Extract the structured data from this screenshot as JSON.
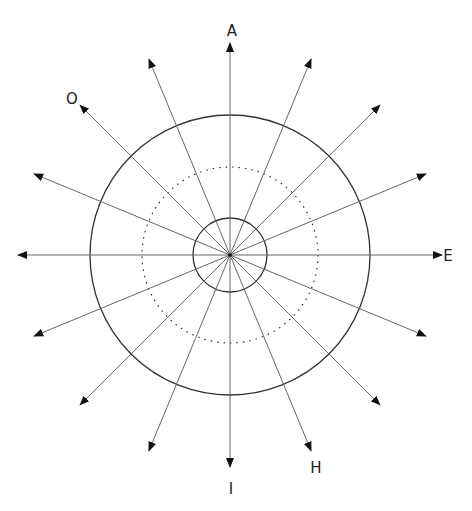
{
  "diagram": {
    "center": {
      "x": 230,
      "y": 255
    },
    "ray_count": 16,
    "ray_length": 212,
    "ray_color": "#666666",
    "circle_color": "#333333",
    "circles": [
      {
        "name": "inner-circle",
        "r": 37,
        "style": "solid"
      },
      {
        "name": "middle-circle",
        "r": 88,
        "style": "dotted"
      },
      {
        "name": "outer-circle",
        "r": 140,
        "style": "solid"
      }
    ],
    "labels": [
      {
        "text": "A",
        "x": 232,
        "y": 36,
        "angle_deg": 90
      },
      {
        "text": "O",
        "x": 72,
        "y": 104,
        "angle_deg": 135
      },
      {
        "text": "E",
        "x": 448,
        "y": 261,
        "angle_deg": 0
      },
      {
        "text": "H",
        "x": 316,
        "y": 473,
        "angle_deg": 292.5
      },
      {
        "text": "I",
        "x": 231,
        "y": 494,
        "angle_deg": 270
      }
    ]
  }
}
